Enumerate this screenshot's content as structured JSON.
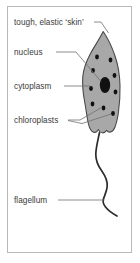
{
  "figure": {
    "type": "labelled-biological-diagram",
    "frame": {
      "border_color": "#b9b9b9",
      "background_color": "#ffffff"
    },
    "colors": {
      "cell_fill": "#a8a8a8",
      "cell_outline": "#4a4a4a",
      "organelle_fill": "#111111",
      "flagellum": "#2b2b2b",
      "leader_line": "#6f6f6f",
      "label_text": "#3a3a3a"
    },
    "labels": [
      {
        "id": "skin",
        "text": "tough, elastic ‘skin’",
        "x": 14,
        "y": 25
      },
      {
        "id": "nucleus",
        "text": "nucleus",
        "x": 14,
        "y": 55
      },
      {
        "id": "cytoplasm",
        "text": "cytoplasm",
        "x": 14,
        "y": 89
      },
      {
        "id": "chloroplasts",
        "text": "chloroplasts",
        "x": 14,
        "y": 123
      },
      {
        "id": "flagellum",
        "text": "flagellum",
        "x": 14,
        "y": 203
      }
    ],
    "structures": [
      {
        "id": "cell-body",
        "name": "euglena-cell-body"
      },
      {
        "id": "nucleus-organelle",
        "name": "nucleus-oval"
      },
      {
        "id": "chloroplast-dots",
        "name": "chloroplast-group",
        "count": 8
      },
      {
        "id": "flagellum-curve",
        "name": "flagellum-tail"
      }
    ]
  }
}
